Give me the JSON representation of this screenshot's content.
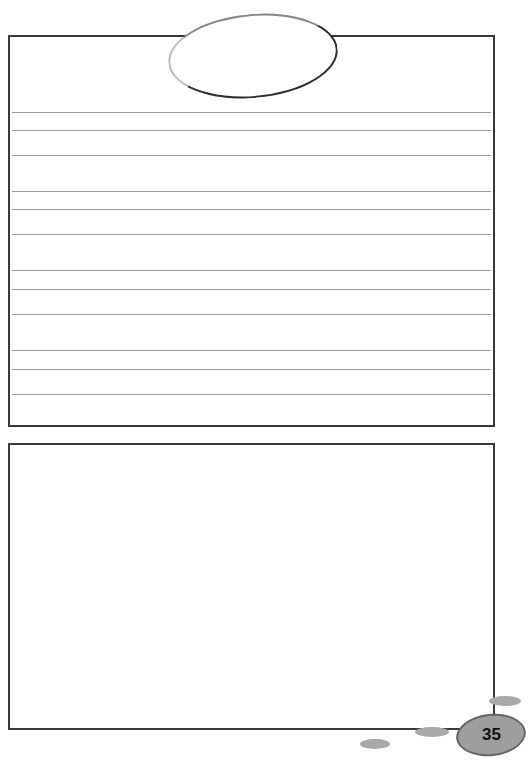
{
  "page": {
    "number": "35",
    "colors": {
      "border": "#3a3a3a",
      "rule": "#9a9a9a",
      "badge": "#9e9e9e",
      "blob": "#a9a9a9"
    }
  },
  "top_section": {
    "title_oval_text": "",
    "ruled_lines_y": [
      112,
      130,
      155,
      191,
      209,
      234,
      270,
      289,
      314,
      350,
      369,
      394
    ]
  },
  "bottom_section": {
    "drawing_area_text": ""
  }
}
